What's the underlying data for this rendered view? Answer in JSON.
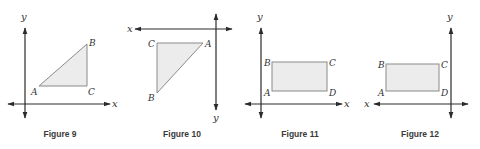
{
  "figures": [
    {
      "caption": "Figure 9",
      "shape_type": "triangle",
      "axes": {
        "x_label": "x",
        "y_label": "y",
        "x_axis": {
          "x1": 8,
          "x2": 110,
          "y": 104,
          "arrows": "both"
        },
        "y_axis": {
          "x": 25,
          "y1": 28,
          "y2": 118,
          "arrows": "both"
        }
      },
      "vertices": [
        {
          "label": "A",
          "x": 39,
          "y": 86
        },
        {
          "label": "B",
          "x": 87,
          "y": 44
        },
        {
          "label": "C",
          "x": 87,
          "y": 86
        }
      ]
    },
    {
      "caption": "Figure 10",
      "shape_type": "triangle",
      "axes": {
        "x_label": "x",
        "y_label": "y",
        "x_axis": {
          "x1": 135,
          "x2": 232,
          "y": 29,
          "arrows": "both"
        },
        "y_axis": {
          "x": 216,
          "y1": 14,
          "y2": 110,
          "arrows": "both"
        }
      },
      "vertices": [
        {
          "label": "C",
          "x": 157,
          "y": 43
        },
        {
          "label": "A",
          "x": 203,
          "y": 43
        },
        {
          "label": "B",
          "x": 157,
          "y": 93
        }
      ]
    },
    {
      "caption": "Figure 11",
      "shape_type": "rectangle",
      "axes": {
        "x_label": "x",
        "y_label": "y",
        "x_axis": {
          "x1": 245,
          "x2": 342,
          "y": 104,
          "arrows": "both"
        },
        "y_axis": {
          "x": 261,
          "y1": 28,
          "y2": 118,
          "arrows": "both"
        }
      },
      "vertices": [
        {
          "label": "B",
          "x": 272,
          "y": 62
        },
        {
          "label": "C",
          "x": 327,
          "y": 62
        },
        {
          "label": "D",
          "x": 327,
          "y": 91
        },
        {
          "label": "A",
          "x": 272,
          "y": 91
        }
      ]
    },
    {
      "caption": "Figure 12",
      "shape_type": "rectangle",
      "axes": {
        "x_label": "x",
        "y_label": "y",
        "x_axis": {
          "x1": 374,
          "x2": 468,
          "y": 104,
          "arrows": "both"
        },
        "y_axis": {
          "x": 451,
          "y1": 28,
          "y2": 118,
          "arrows": "both"
        }
      },
      "vertices": [
        {
          "label": "B",
          "x": 386,
          "y": 64
        },
        {
          "label": "C",
          "x": 439,
          "y": 64
        },
        {
          "label": "D",
          "x": 439,
          "y": 91
        },
        {
          "label": "A",
          "x": 386,
          "y": 91
        }
      ]
    }
  ],
  "colors": {
    "shape_fill": "#ececec",
    "shape_stroke": "#8a8a8a",
    "axis": "#2b2b2b",
    "text": "#333333"
  }
}
